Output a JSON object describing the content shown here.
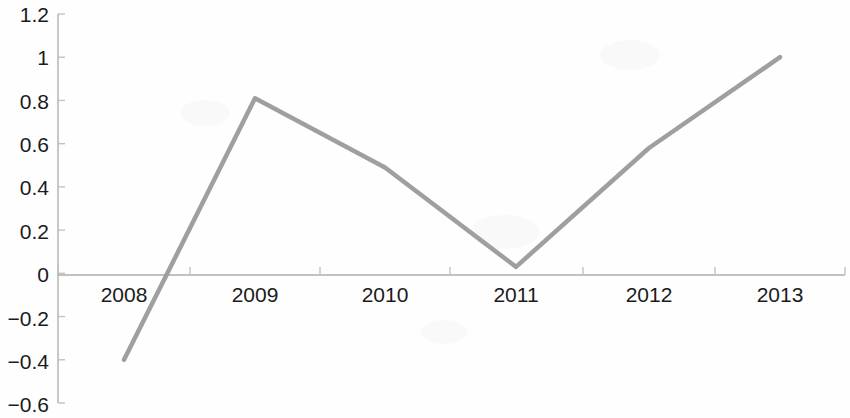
{
  "chart_data": {
    "type": "line",
    "title": "",
    "subtitle": "",
    "xlabel": "",
    "ylabel": "",
    "categories": [
      "2008",
      "2009",
      "2010",
      "2011",
      "2012",
      "2013"
    ],
    "values": [
      -0.4,
      0.81,
      0.49,
      0.03,
      0.58,
      1.0
    ],
    "series": [
      {
        "name": "",
        "values": [
          -0.4,
          0.81,
          0.49,
          0.03,
          0.58,
          1.0
        ],
        "color": "#9a9a9a"
      }
    ],
    "ylim": [
      -0.6,
      1.2
    ],
    "ytick_values": [
      1.2,
      1,
      0.8,
      0.6,
      0.4,
      0.2,
      0,
      -0.2,
      -0.4,
      -0.6
    ],
    "ytick_labels": [
      "1.2",
      "1",
      "0.8",
      "0.6",
      "0.4",
      "0.2",
      "0",
      "−0.2",
      "−0.4",
      "−0.6"
    ],
    "xtick_labels": [
      "2008",
      "2009",
      "2010",
      "2011",
      "2012",
      "2013"
    ],
    "grid": false,
    "legend": false,
    "legend_position": "none",
    "markers": false,
    "zero_line": true,
    "annotations": []
  },
  "style": {
    "line_color": "#9a9a9a",
    "axis_color": "#b9b9b9",
    "zero_line_color": "#adadad",
    "tick_color": "#c2c2c2",
    "label_color": "#1b1b1b",
    "background_color": "#fefefe",
    "line_width": 4.5
  },
  "geometry": {
    "plot_left": 58,
    "plot_right": 845,
    "plot_top": 14,
    "plot_bottom": 403,
    "zero_y": 275,
    "band_centers": [
      124,
      255,
      385,
      516,
      649,
      780
    ],
    "tick_x": [
      58,
      190,
      320,
      450,
      583,
      715,
      845
    ]
  }
}
